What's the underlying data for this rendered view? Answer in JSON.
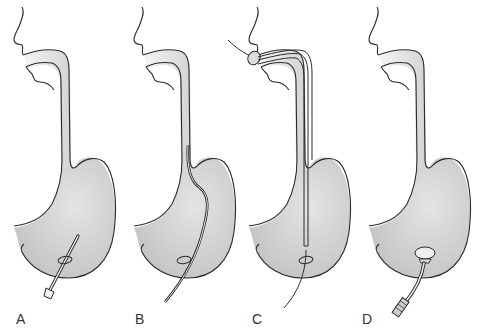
{
  "figure": {
    "panels": [
      {
        "label": "A",
        "step": "Needle/catheter inserted through abdominal wall into stomach"
      },
      {
        "label": "B",
        "step": "Guidewire passed up through esophagus"
      },
      {
        "label": "C",
        "step": "Tube pulled down over wire from the mouth"
      },
      {
        "label": "D",
        "step": "Tube bumper seated against stomach wall"
      }
    ]
  },
  "colors": {
    "stroke": "#2a2a2a",
    "stomach_fill": "#c9c9c9",
    "stomach_highlight": "#e2e2e2",
    "esophagus_fill": "#dcdcdc",
    "background": "#ffffff"
  }
}
